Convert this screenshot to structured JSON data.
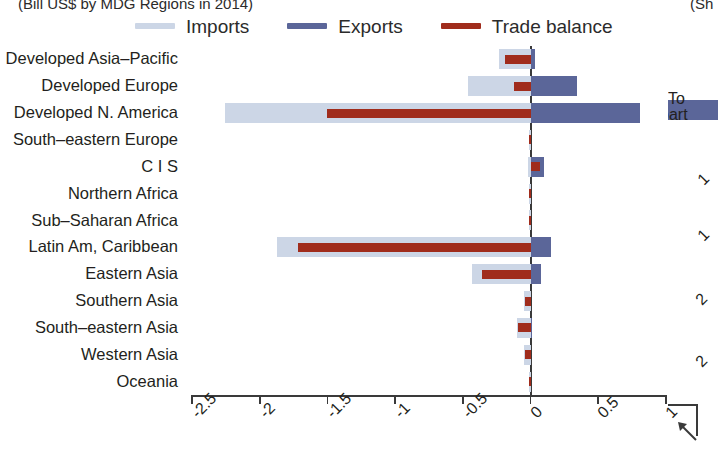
{
  "titles": {
    "left": "(Bill US$ by MDG Regions in 2014)",
    "right": "(Sh"
  },
  "legend": {
    "items": [
      {
        "label": "Imports",
        "color": "#ccd6e6",
        "name": "imports"
      },
      {
        "label": "Exports",
        "color": "#5b6699",
        "name": "exports"
      },
      {
        "label": "Trade balance",
        "color": "#a02c1c",
        "name": "trade-balance"
      }
    ]
  },
  "right_panel": {
    "line1": "To",
    "line2": "part",
    "ticks": [
      "1",
      "1",
      "2",
      "2"
    ]
  },
  "axis": {
    "ticks": [
      "-2.5",
      "-2",
      "-1.5",
      "-1",
      "-0.5",
      "0",
      "0.5",
      "1"
    ],
    "tick_values": [
      -2.5,
      -2,
      -1.5,
      -1,
      -0.5,
      0,
      0.5,
      1
    ]
  },
  "chart_data": {
    "type": "bar",
    "orientation": "horizontal",
    "title": "(Bill US$ by MDG Regions in 2014)",
    "xlabel": "",
    "ylabel": "",
    "xlim": [
      -2.5,
      1.0
    ],
    "grid": false,
    "legend_position": "top",
    "categories": [
      "Developed Asia–Pacific",
      "Developed Europe",
      "Developed N. America",
      "South–eastern Europe",
      "C I S",
      "Northern Africa",
      "Sub–Saharan Africa",
      "Latin Am, Caribbean",
      "Eastern Asia",
      "Southern Asia",
      "South–eastern Asia",
      "Western Asia",
      "Oceania"
    ],
    "series": [
      {
        "name": "Imports",
        "color": "#ccd6e6",
        "values": [
          -0.23,
          -0.46,
          -2.26,
          -0.01,
          -0.02,
          -0.01,
          -0.01,
          -1.87,
          -0.43,
          -0.05,
          -0.1,
          -0.05,
          -0.01
        ]
      },
      {
        "name": "Exports",
        "color": "#5b6699",
        "values": [
          0.03,
          0.34,
          0.81,
          0.0,
          0.1,
          0.0,
          0.0,
          0.15,
          0.08,
          0.0,
          0.01,
          0.0,
          0.0
        ]
      },
      {
        "name": "Trade balance",
        "color": "#a02c1c",
        "values": [
          -0.19,
          -0.12,
          -1.5,
          -0.01,
          0.07,
          -0.01,
          -0.01,
          -1.72,
          -0.36,
          -0.04,
          -0.09,
          -0.04,
          -0.01
        ]
      }
    ]
  }
}
